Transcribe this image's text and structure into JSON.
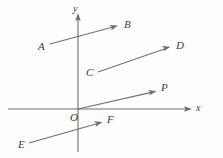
{
  "figure": {
    "width": 223,
    "height": 158,
    "background_color": "#fefefe",
    "stroke_color": "#6f6f6f",
    "text_color": "#3a3a3a"
  },
  "axes": {
    "x_axis": {
      "label": "x",
      "label_x": 196,
      "label_y": 103,
      "y": 109,
      "x_start": 8,
      "x_end": 190,
      "arrow_at": "end"
    },
    "y_axis": {
      "label": "y",
      "label_x": 73,
      "label_y": 4,
      "x": 78,
      "y_start": 152,
      "y_end": 14,
      "arrow_at": "end"
    },
    "origin": {
      "label": "O",
      "label_x": 70,
      "label_y": 112,
      "x": 78,
      "y": 109
    }
  },
  "vectors": [
    {
      "name": "AB",
      "tail_label": "A",
      "head_label": "B",
      "tail_label_x": 38,
      "tail_label_y": 41,
      "head_label_x": 124,
      "head_label_y": 19,
      "x1": 50,
      "y1": 44,
      "x2": 117,
      "y2": 26
    },
    {
      "name": "CD",
      "tail_label": "C",
      "head_label": "D",
      "tail_label_x": 86,
      "tail_label_y": 67,
      "head_label_x": 176,
      "head_label_y": 40,
      "x1": 98,
      "y1": 72,
      "x2": 170,
      "y2": 47
    },
    {
      "name": "OP",
      "tail_label": "",
      "head_label": "P",
      "tail_label_x": 0,
      "tail_label_y": 0,
      "head_label_x": 161,
      "head_label_y": 82,
      "x1": 78,
      "y1": 109,
      "x2": 156,
      "y2": 91
    },
    {
      "name": "EF",
      "tail_label": "E",
      "head_label": "F",
      "tail_label_x": 18,
      "tail_label_y": 139,
      "head_label_x": 107,
      "head_label_y": 114,
      "x1": 29,
      "y1": 143,
      "x2": 102,
      "y2": 122
    }
  ]
}
